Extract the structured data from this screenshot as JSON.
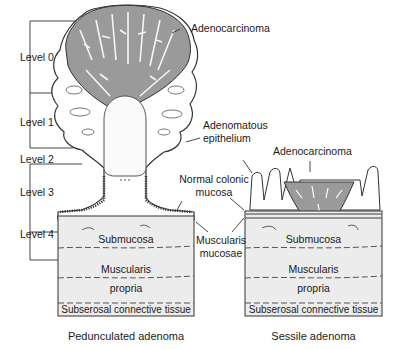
{
  "diagram": {
    "levels": [
      "Level 0",
      "Level 1",
      "Level 2",
      "Level 3",
      "Level 4"
    ],
    "labels": {
      "adenocarcinoma_top": "Adenocarcinoma",
      "adenomatous_epithelium_1": "Adenomatous",
      "adenomatous_epithelium_2": "epithelium",
      "adenocarcinoma_sessile": "Adenocarcinoma",
      "normal_colonic_1": "Normal colonic",
      "normal_colonic_2": "mucosa",
      "muscularis_mucosae_1": "Muscularis",
      "muscularis_mucosae_2": "mucosae"
    },
    "left_block": {
      "submucosa": "Submucosa",
      "muscularis_1": "Muscularis",
      "muscularis_2": "propria",
      "subserosal": "Subserosal connective tissue",
      "caption": "Pedunculated adenoma"
    },
    "right_block": {
      "submucosa": "Submucosa",
      "muscularis_1": "Muscularis",
      "muscularis_2": "propria",
      "subserosal": "Subserosal connective tissue",
      "caption": "Sessile adenoma"
    },
    "colors": {
      "tumor_fill": "#9a9a9a",
      "tissue_fill": "#ececec",
      "line": "#333333"
    }
  }
}
